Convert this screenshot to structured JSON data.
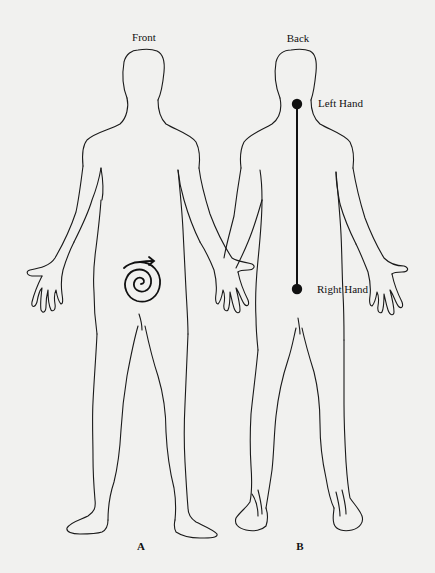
{
  "figures": [
    {
      "id": "A",
      "view_label": "Front",
      "panel_label": "A",
      "markers": [
        {
          "type": "spiral",
          "icon": "clockwise-spiral-arrow-icon",
          "location": "lower abdomen"
        }
      ]
    },
    {
      "id": "B",
      "view_label": "Back",
      "panel_label": "B",
      "markers": [
        {
          "type": "point",
          "label": "Left Hand",
          "location": "upper spine (between shoulder blades)"
        },
        {
          "type": "point",
          "label": "Right Hand",
          "location": "lower spine (sacrum)"
        }
      ],
      "connector": "vertical line along spine"
    }
  ],
  "colors": {
    "background": "#f1f1ef",
    "ink": "#111111"
  }
}
